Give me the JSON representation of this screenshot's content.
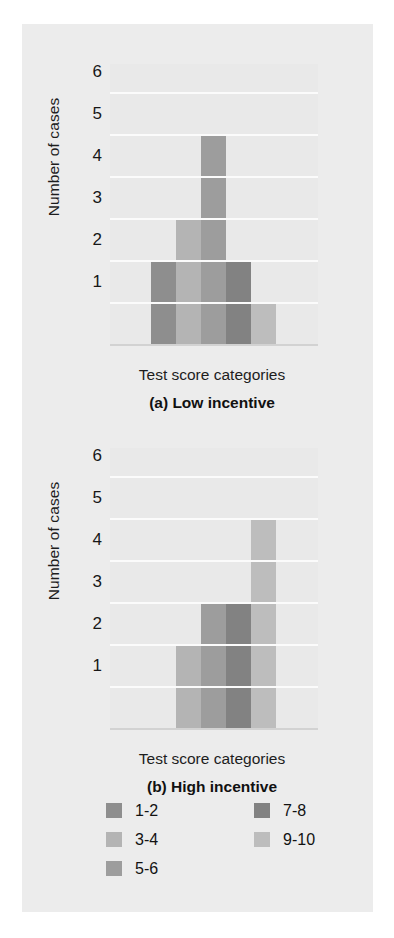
{
  "figure": {
    "background": "#ececec",
    "page_background": "#ffffff"
  },
  "palette": {
    "c1_2": "#8e8e8e",
    "c3_4": "#b4b4b4",
    "c5_6": "#9d9d9d",
    "c7_8": "#828282",
    "c9_10": "#bdbdbd",
    "gridline": "#fbfbfb",
    "plot_bg": "#e9e9e9",
    "text": "#171717"
  },
  "legend": {
    "columns": [
      {
        "items": [
          {
            "label": "1-2",
            "color": "#8e8e8e"
          },
          {
            "label": "3-4",
            "color": "#b4b4b4"
          },
          {
            "label": "5-6",
            "color": "#9d9d9d"
          }
        ]
      },
      {
        "items": [
          {
            "label": "7-8",
            "color": "#828282"
          },
          {
            "label": "9-10",
            "color": "#bdbdbd"
          }
        ]
      }
    ]
  },
  "chart_data": [
    {
      "type": "bar",
      "panel": "a",
      "title": "(a) Low incentive",
      "xlabel": "Test score categories",
      "ylabel": "Number of cases",
      "categories": [
        "1-2",
        "3-4",
        "5-6",
        "7-8",
        "9-10"
      ],
      "values": [
        2,
        3,
        5,
        2,
        1
      ],
      "colors": [
        "#8e8e8e",
        "#b4b4b4",
        "#9d9d9d",
        "#828282",
        "#bdbdbd"
      ],
      "yticks": [
        1,
        2,
        3,
        4,
        5,
        6
      ],
      "ylim": [
        0,
        6.6
      ],
      "grid": true,
      "legend_position": "below-figure"
    },
    {
      "type": "bar",
      "panel": "b",
      "title": "(b) High incentive",
      "xlabel": "Test score categories",
      "ylabel": "Number of cases",
      "categories": [
        "1-2",
        "3-4",
        "5-6",
        "7-8",
        "9-10"
      ],
      "values": [
        0,
        2,
        3,
        3,
        5
      ],
      "colors": [
        "#8e8e8e",
        "#b4b4b4",
        "#9d9d9d",
        "#828282",
        "#bdbdbd"
      ],
      "yticks": [
        1,
        2,
        3,
        4,
        5,
        6
      ],
      "ylim": [
        0,
        6.6
      ],
      "grid": true,
      "legend_position": "below-figure"
    }
  ]
}
